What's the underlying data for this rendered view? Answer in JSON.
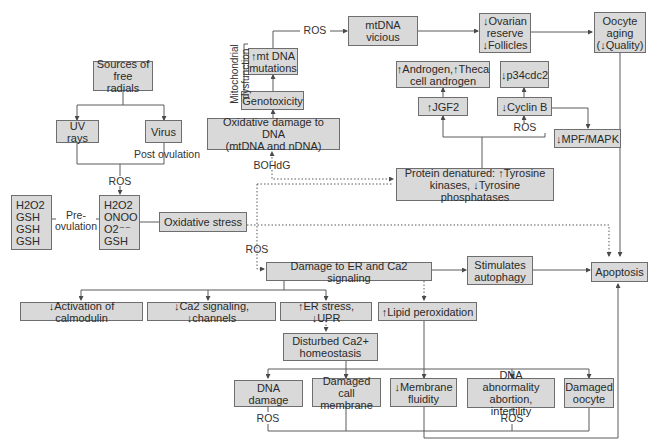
{
  "nodes": {
    "sources": "Sources of\nfree radials",
    "uv": "UV rays",
    "virus": "Virus",
    "mt_mutations": "↑mt DNA\nmutations",
    "genotoxicity": "Genotoxicity",
    "oxidative_dna": "Oxidative damage to DNA\n(mtDNA and nDNA)",
    "mtdna_vicious": "mtDNA\nvicious",
    "ovarian": "↓Ovarian\nreserve\n↓Follicles",
    "oocyte_aging": "Oocyte\naging\n(↓Quality)",
    "androgen": "↑Androgen,↑Theca\ncell androgen",
    "p34": "↓p34cdc2",
    "jgf2": "↑JGF2",
    "cyclin": "↓Cyclin B",
    "mpf": "↓MPF/MAPK",
    "protein": "Protein denatured: ↑Tyrosine\nkinases, ↓Tyrosine phosphatases",
    "left_species": "H2O2\nGSH\nGSH\nGSH",
    "right_species": "H2O2\nONOO\nO2⁻⁻\nGSH",
    "oxidative_stress": "Oxidative stress",
    "damage_er": "Damage to ER and Ca2 signaling",
    "autophagy": "Stimulates\nautophagy",
    "apoptosis": "Apoptosis",
    "calmodulin": "↓Activation of calmodulin",
    "ca2_signaling": "↓Ca2 signaling, ↓channels",
    "er_stress": "↑ER stress, ↓UPR",
    "lipid": "↑Lipid peroxidation",
    "disturbed_ca": "Disturbed Ca2+\nhomeostasis",
    "dna_damage": "DNA damage",
    "damaged_membrane": "Damaged call\nmembrane",
    "membrane_fluidity": "↓Membrane\nfluidity",
    "dna_abnormality": "DNA abnormality\nabortion, infertility",
    "damaged_oocyte": "Damaged\noocyte"
  },
  "labels": {
    "ros_top": "ROS",
    "post_ovulation": "Post ovulation",
    "ros_sources": "ROS",
    "pre_ovulation": "Pre-\novulation",
    "bohdg": "BOHdG",
    "ros_cyclin": "ROS",
    "ros_er": "ROS",
    "ros_dna_damage": "ROS",
    "ros_dna_abnormality": "ROS",
    "mito_dysfunction": "Mitochondrial\ndysfunction"
  },
  "colors": {
    "box_fill": "#d9d9d9",
    "box_border": "#6e6e6e",
    "line": "#5a5a5a"
  }
}
